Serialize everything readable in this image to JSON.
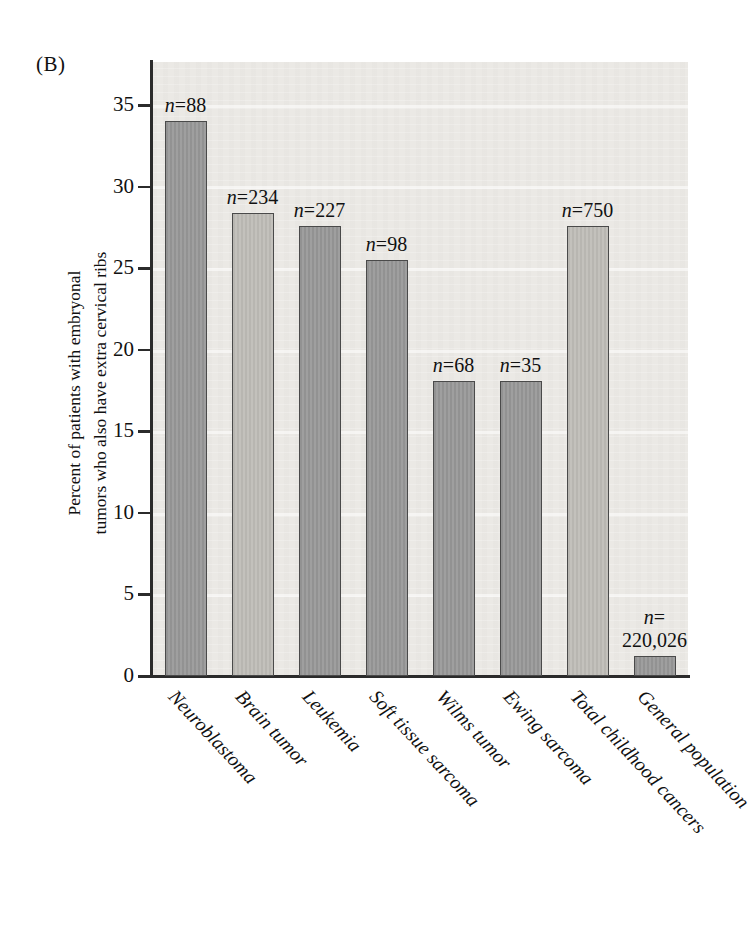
{
  "panel": {
    "letter": "(B)"
  },
  "axis": {
    "y_title_line1": "Percent of patients with embryonal",
    "y_title_line2": "tumors who also have extra cervical ribs",
    "y_ticks": [
      "0",
      "5",
      "10",
      "15",
      "20",
      "25",
      "30",
      "35"
    ]
  },
  "chart_data": {
    "type": "bar",
    "title": "(B)",
    "xlabel": "",
    "ylabel": "Percent of patients with embryonal tumors who also have extra cervical ribs",
    "ylim": [
      0,
      37
    ],
    "yticks": [
      0,
      5,
      10,
      15,
      20,
      25,
      30,
      35
    ],
    "grid": false,
    "legend": "none",
    "categories": [
      "Neuroblastoma",
      "Brain tumor",
      "Leukemia",
      "Soft tissue sarcoma",
      "Wilms tumor",
      "Ewing sarcoma",
      "Total childhood cancers",
      "General population"
    ],
    "values": [
      34.0,
      28.4,
      27.6,
      25.5,
      18.1,
      18.1,
      27.6,
      1.2
    ],
    "point_labels": [
      "n=88",
      "n=234",
      "n=227",
      "n=98",
      "n=68",
      "n=35",
      "n=750",
      "n=\n220,026"
    ],
    "sample_sizes": [
      88,
      234,
      227,
      98,
      68,
      35,
      750,
      220026
    ],
    "bar_shades": [
      "dark",
      "light",
      "dark",
      "dark",
      "dark",
      "dark",
      "light",
      "dark"
    ],
    "colors": {
      "bar_dark": "#9a9a9a",
      "bar_light": "#bfbdb8",
      "bar_border": "#4a4a4a",
      "axis": "#2b2b2b",
      "plot_background": "#ebe9e5",
      "page_background": "#ffffff",
      "text": "#111111"
    }
  },
  "n_labels": [
    {
      "line1": "n=88",
      "line2": ""
    },
    {
      "line1": "n=234",
      "line2": ""
    },
    {
      "line1": "n=227",
      "line2": ""
    },
    {
      "line1": "n=98",
      "line2": ""
    },
    {
      "line1": "n=68",
      "line2": ""
    },
    {
      "line1": "n=35",
      "line2": ""
    },
    {
      "line1": "n=750",
      "line2": ""
    },
    {
      "line1": "n=",
      "line2": "220,026"
    }
  ]
}
